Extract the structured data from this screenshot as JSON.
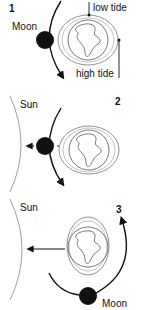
{
  "panels": [
    {
      "number": "1",
      "labels": {
        "moon": "Moon",
        "low_tide": "low tide",
        "high_tide": "high tide"
      }
    },
    {
      "number": "2",
      "labels": {
        "sun": "Sun"
      }
    },
    {
      "number": "3",
      "labels": {
        "sun": "Sun",
        "moon": "Moon"
      }
    }
  ],
  "colors": {
    "ink": "#111111",
    "line": "#777777",
    "background": "#ffffff"
  }
}
